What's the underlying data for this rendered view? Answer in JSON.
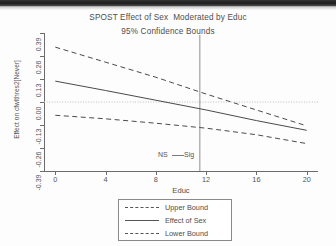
{
  "figure": {
    "title": "SPOST Effect of Sex  Moderated by Educ",
    "subtitle": "95% Confidence Bounds"
  },
  "annotations": {
    "ns_label": "NS",
    "sig_label": "Sig",
    "divider_x": 11.5
  },
  "legend": {
    "items": [
      {
        "label": "Upper Bound",
        "style": "dashed"
      },
      {
        "label": "Effect of Sex",
        "style": "solid"
      },
      {
        "label": "Lower Bound",
        "style": "dashed"
      }
    ]
  },
  "colors": {
    "line": "#4a4a4a",
    "axis": "#6b6b6b",
    "text": "#4d4d4d",
    "zeroline": "#bdbdbd"
  },
  "chart_data": {
    "type": "line",
    "title": "SPOST Effect of Sex  Moderated by Educ",
    "subtitle": "95% Confidence Bounds",
    "xlabel": "Educ",
    "ylabel": "Effect on cfwlthres2[Never]",
    "xlim": [
      -0.9,
      20.9
    ],
    "ylim": [
      -0.39,
      0.39
    ],
    "xticks": [
      0,
      4,
      8,
      12,
      16,
      20
    ],
    "xticklabels": [
      "0",
      "4",
      "8",
      "12",
      "16",
      "20"
    ],
    "yticks": [
      0.39,
      0.26,
      0.13,
      0.0,
      -0.13,
      -0.26,
      -0.39
    ],
    "yticklabels": [
      "0.39",
      "0.26",
      "0.13",
      "0.00",
      "-0.13",
      "-0.26",
      "-0.39"
    ],
    "grid": false,
    "legend_position": "below-center",
    "reference_lines": [
      {
        "name": "zero-line",
        "orientation": "horizontal",
        "value": 0.0,
        "style": "dotted"
      },
      {
        "name": "significance-divider",
        "orientation": "vertical",
        "value": 11.5,
        "style": "solid"
      }
    ],
    "x": [
      0,
      4,
      8,
      12,
      16,
      20
    ],
    "series": [
      {
        "name": "Upper Bound",
        "style": "dashed",
        "values": [
          0.31,
          0.225,
          0.14,
          0.045,
          -0.045,
          -0.135
        ]
      },
      {
        "name": "Effect of Sex",
        "style": "solid",
        "values": [
          0.118,
          0.065,
          0.01,
          -0.045,
          -0.105,
          -0.16
        ]
      },
      {
        "name": "Lower Bound",
        "style": "dashed",
        "values": [
          -0.075,
          -0.095,
          -0.12,
          -0.148,
          -0.185,
          -0.235
        ]
      }
    ]
  }
}
